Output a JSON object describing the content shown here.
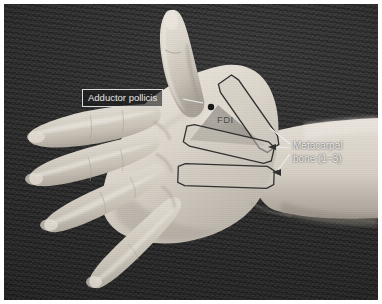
{
  "figure": {
    "kind": "annotated-photograph",
    "colors": {
      "frame": "#ffffff",
      "backdrop": "#2d2d2d",
      "skin_light": "#e3ded6",
      "skin_mid": "#c7c0b6",
      "skin_shadow": "#9c958b",
      "label_text": "#eaeaea",
      "label_box_border": "#dcdcdc",
      "label_box_fill": "rgba(22,22,22,0.60)",
      "bone_outline": "#2f2f2f",
      "bone_fill": "rgba(210,204,194,0.55)",
      "fdi_fill": "rgba(120,116,110,0.55)",
      "fdi_text": "#4d4d4d",
      "marker_dot": "#1a1a1a",
      "leader_line": "#efefef"
    }
  },
  "annotations": {
    "adductor_pollicis": {
      "label": "Adductor pollicis",
      "boxed": true,
      "marker": "dot"
    },
    "fdi": {
      "label": "FDI",
      "shape": "shaded-triangle",
      "boxed": false
    },
    "metacarpal": {
      "line1": "Metacarpal",
      "line2": "bone (1−3)",
      "boxed": false,
      "leader_count": 3
    }
  },
  "bones": [
    {
      "name": "metacarpal-1",
      "index": "1",
      "rotation_deg": 55
    },
    {
      "name": "metacarpal-2",
      "index": "2",
      "rotation_deg": 13
    },
    {
      "name": "metacarpal-3",
      "index": "3",
      "rotation_deg": 2
    }
  ]
}
